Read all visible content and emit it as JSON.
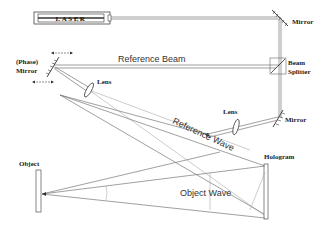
{
  "diagram": {
    "components": {
      "laser": {
        "label": "LASER"
      },
      "mirror_top": {
        "label": "Mirror"
      },
      "beam_splitter": {
        "label_line1": "Beam",
        "label_line2": "Splitter"
      },
      "phase_mirror": {
        "label_line1": "(Phase)",
        "label_line2": "Mirror"
      },
      "lens_left": {
        "label": "Lens"
      },
      "lens_right": {
        "label": "Lens"
      },
      "mirror_right": {
        "label": "Mirror"
      },
      "object": {
        "label": "Object"
      },
      "hologram": {
        "label": "Hologram"
      }
    },
    "beams": {
      "reference_beam": {
        "label": "Reference Beam"
      },
      "reference_wave": {
        "label": "Reference Wave"
      },
      "object_wave": {
        "label": "Object Wave"
      }
    },
    "colors": {
      "line": "#777777",
      "part": "#444444",
      "text": "#222222",
      "background": "#ffffff"
    }
  }
}
